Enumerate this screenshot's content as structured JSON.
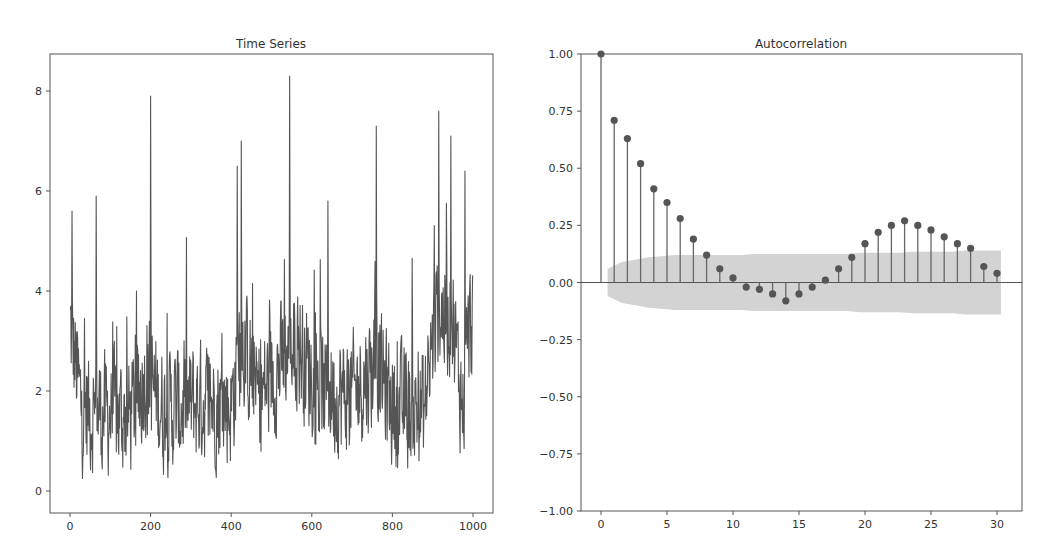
{
  "figure": {
    "background": "#ffffff",
    "line_color": "#555555",
    "axis_color": "#555555",
    "text_color": "#333333",
    "band_color": "#d3d3d3",
    "stem_color": "#666666",
    "marker_color": "#555555"
  },
  "chart_data": [
    {
      "type": "line",
      "title": "Time Series",
      "xlabel": "",
      "ylabel": "",
      "xlim": [
        -50,
        1050
      ],
      "ylim": [
        -0.4,
        8.7
      ],
      "xticks": [
        0,
        200,
        400,
        600,
        800,
        1000
      ],
      "yticks": [
        0,
        2,
        4,
        6,
        8
      ],
      "grid": false,
      "n_points": 1000,
      "description": "Noisy non-negative series fluctuating mostly between 0 and 4 with sharp spikes; prominent peaks near x≈200 (~7.9), x≈420 (~7.0), x≈545 (~8.3), x≈760 (~7.3), x≈915 (~7.6)",
      "peaks": [
        {
          "x": 5,
          "y": 5.6
        },
        {
          "x": 65,
          "y": 5.9
        },
        {
          "x": 200,
          "y": 7.9
        },
        {
          "x": 415,
          "y": 6.5
        },
        {
          "x": 425,
          "y": 7.0
        },
        {
          "x": 545,
          "y": 8.3
        },
        {
          "x": 640,
          "y": 5.8
        },
        {
          "x": 760,
          "y": 7.3
        },
        {
          "x": 915,
          "y": 7.6
        },
        {
          "x": 945,
          "y": 7.1
        },
        {
          "x": 980,
          "y": 6.4
        }
      ]
    },
    {
      "type": "bar",
      "subtype": "stem",
      "title": "Autocorrelation",
      "xlabel": "",
      "ylabel": "",
      "xlim": [
        -1.5,
        31.5
      ],
      "ylim": [
        -1.0,
        1.0
      ],
      "xticks": [
        0,
        5,
        10,
        15,
        20,
        25,
        30
      ],
      "yticks": [
        1.0,
        0.75,
        0.5,
        0.25,
        0.0,
        -0.25,
        -0.5,
        -0.75,
        -1.0
      ],
      "ytick_labels": [
        "1.00",
        "0.75",
        "0.50",
        "0.25",
        "0.00",
        "−0.25",
        "−0.50",
        "−0.75",
        "−1.00"
      ],
      "grid": false,
      "x": [
        0,
        1,
        2,
        3,
        4,
        5,
        6,
        7,
        8,
        9,
        10,
        11,
        12,
        13,
        14,
        15,
        16,
        17,
        18,
        19,
        20,
        21,
        22,
        23,
        24,
        25,
        26,
        27,
        28,
        29,
        30
      ],
      "values": [
        1.0,
        0.71,
        0.63,
        0.52,
        0.41,
        0.35,
        0.28,
        0.19,
        0.12,
        0.06,
        0.02,
        -0.02,
        -0.03,
        -0.05,
        -0.08,
        -0.05,
        -0.02,
        0.01,
        0.06,
        0.11,
        0.17,
        0.22,
        0.25,
        0.27,
        0.25,
        0.23,
        0.2,
        0.17,
        0.15,
        0.07,
        0.04
      ],
      "confidence_band": {
        "upper": [
          0.06,
          0.09,
          0.1,
          0.11,
          0.115,
          0.12,
          0.12,
          0.12,
          0.12,
          0.12,
          0.12,
          0.125,
          0.125,
          0.125,
          0.125,
          0.125,
          0.125,
          0.125,
          0.125,
          0.13,
          0.13,
          0.13,
          0.13,
          0.135,
          0.135,
          0.135,
          0.135,
          0.14,
          0.14,
          0.14
        ],
        "lags_start": 1,
        "description": "Shaded 95% confidence interval around zero, widening from ~±0.06 at lag 1 to ~±0.14 at lag 30"
      }
    }
  ]
}
